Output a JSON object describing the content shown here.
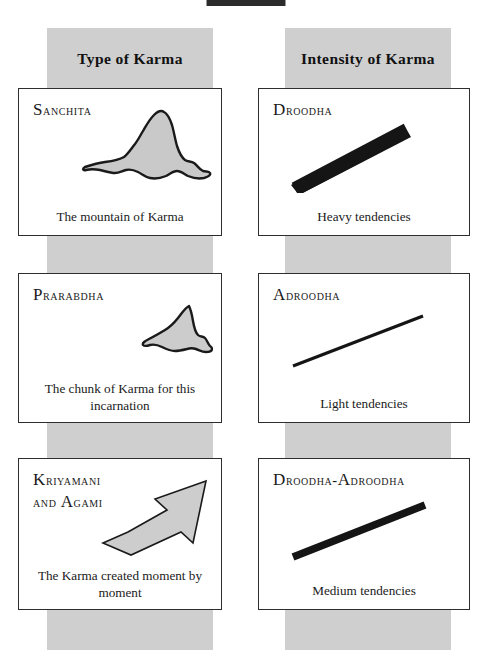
{
  "page": {
    "background_color": "#ffffff",
    "band_color": "#cfcfcf",
    "ink_color": "#1a1a1a"
  },
  "columns": [
    {
      "id": "type",
      "header": "Type of Karma"
    },
    {
      "id": "intensity",
      "header": "Intensity of Karma"
    }
  ],
  "cards": {
    "type": [
      {
        "title_first": "S",
        "title_rest": "anchita",
        "title_full": "Sanchita",
        "caption": "The mountain of Karma",
        "icon": "mountain-shape"
      },
      {
        "title_first": "P",
        "title_rest": "rarabdha",
        "title_full": "Prarabdha",
        "caption": "The chunk of Karma for this incarnation",
        "icon": "chunk-shape"
      },
      {
        "title_first": "K",
        "title_rest": "riyamani",
        "title_line2_first_a": "and",
        "title_line2_first": "A",
        "title_line2_rest": "gami",
        "title_full": "Kriyamani and Agami",
        "caption": "The Karma created moment by moment",
        "icon": "up-right-arrow-shape"
      }
    ],
    "intensity": [
      {
        "title_first": "D",
        "title_rest": "roodha",
        "title_full": "Droodha",
        "caption": "Heavy tendencies",
        "icon": "thick-diagonal-bar"
      },
      {
        "title_first": "A",
        "title_rest": "droodha",
        "title_full": "Adroodha",
        "caption": "Light tendencies",
        "icon": "thin-diagonal-line"
      },
      {
        "title_first": "D",
        "title_rest": "roodha-",
        "title_second_first": "A",
        "title_second_rest": "droodha",
        "title_full": "Droodha-Adroodha",
        "caption": "Medium tendencies",
        "icon": "medium-diagonal-bar"
      }
    ]
  }
}
